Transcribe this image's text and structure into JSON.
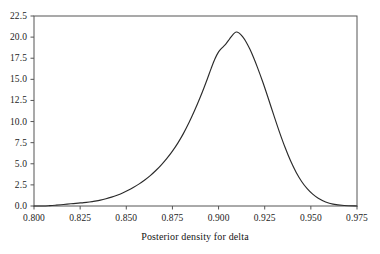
{
  "chart_data": {
    "type": "line",
    "title": "",
    "subtitle": "",
    "xlabel": "Posterior density for delta",
    "ylabel": "",
    "xlim": [
      0.8,
      0.975
    ],
    "ylim": [
      0.0,
      22.5
    ],
    "grid": false,
    "legend": null,
    "annotations": [],
    "xticks": [
      "0.800",
      "0.825",
      "0.850",
      "0.875",
      "0.900",
      "0.925",
      "0.950",
      "0.975"
    ],
    "xtick_values": [
      0.8,
      0.825,
      0.85,
      0.875,
      0.9,
      0.925,
      0.95,
      0.975
    ],
    "yticks": [
      "0.0",
      "2.5",
      "5.0",
      "7.5",
      "10.0",
      "12.5",
      "15.0",
      "17.5",
      "20.0",
      "22.5"
    ],
    "ytick_values": [
      0.0,
      2.5,
      5.0,
      7.5,
      10.0,
      12.5,
      15.0,
      17.5,
      20.0,
      22.5
    ],
    "series": [
      {
        "name": "Posterior density for delta",
        "color": "#2b2b2b",
        "x": [
          0.8,
          0.805,
          0.8085,
          0.812,
          0.816,
          0.82,
          0.824,
          0.827,
          0.83,
          0.833,
          0.836,
          0.839,
          0.842,
          0.845,
          0.848,
          0.851,
          0.854,
          0.857,
          0.86,
          0.863,
          0.866,
          0.869,
          0.872,
          0.875,
          0.878,
          0.881,
          0.884,
          0.887,
          0.89,
          0.892,
          0.894,
          0.896,
          0.898,
          0.9,
          0.902,
          0.904,
          0.906,
          0.908,
          0.9095,
          0.911,
          0.913,
          0.915,
          0.917,
          0.919,
          0.921,
          0.924,
          0.927,
          0.93,
          0.933,
          0.936,
          0.939,
          0.942,
          0.945,
          0.948,
          0.951,
          0.954,
          0.958,
          0.962,
          0.968,
          0.975
        ],
        "y": [
          0.0,
          0.0,
          0.04,
          0.1,
          0.18,
          0.26,
          0.34,
          0.4,
          0.48,
          0.58,
          0.7,
          0.86,
          1.05,
          1.28,
          1.55,
          1.86,
          2.22,
          2.62,
          3.08,
          3.6,
          4.2,
          4.88,
          5.64,
          6.5,
          7.48,
          8.6,
          9.88,
          11.3,
          12.85,
          13.95,
          15.1,
          16.3,
          17.4,
          18.25,
          18.75,
          19.2,
          19.8,
          20.35,
          20.6,
          20.5,
          20.05,
          19.4,
          18.55,
          17.55,
          16.45,
          14.65,
          12.7,
          10.7,
          8.75,
          6.95,
          5.35,
          4.0,
          2.9,
          2.05,
          1.4,
          0.92,
          0.48,
          0.22,
          0.06,
          0.0
        ]
      }
    ]
  },
  "axes": {
    "frame": {
      "left_px": 34,
      "right_px": 357,
      "top_px": 16,
      "bottom_px": 206
    }
  }
}
